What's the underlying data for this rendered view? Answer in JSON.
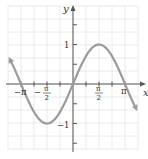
{
  "chart_data": {
    "type": "line",
    "title": "",
    "function": "y = sin x",
    "xlabel": "x",
    "ylabel": "y",
    "xlim": [
      -4.3,
      4.2
    ],
    "ylim": [
      -2.0,
      1.95
    ],
    "x_ticks": [
      {
        "value": -3.14159,
        "label": "-π"
      },
      {
        "value": -1.5708,
        "label": "-π/2"
      },
      {
        "value": 1.5708,
        "label": "π/2"
      },
      {
        "value": 3.14159,
        "label": "π"
      }
    ],
    "y_ticks": [
      {
        "value": 1,
        "label": "1"
      },
      {
        "value": -1,
        "label": "-1"
      }
    ],
    "grid": true,
    "series": [
      {
        "name": "sin x",
        "x": [
          -3.93,
          -3.14159,
          -2.356,
          -1.5708,
          -0.785,
          0,
          0.785,
          1.5708,
          2.356,
          3.14159,
          3.93
        ],
        "values": [
          0.707,
          0,
          -0.707,
          -1,
          -0.707,
          0,
          0.707,
          1,
          0.707,
          0,
          -0.707
        ],
        "arrows_both_ends": true
      }
    ],
    "colors": {
      "curve": "#9a9a9a",
      "axis": "#555555",
      "grid": "#e2e2e2"
    }
  },
  "labels": {
    "x_axis": "x",
    "y_axis": "y",
    "neg_pi": "−π",
    "neg_pi_half_num": "π",
    "neg_pi_half_den": "2",
    "neg_sign": "−",
    "pi_half_num": "π",
    "pi_half_den": "2",
    "pi": "π",
    "one": "1",
    "neg_one": "−1"
  }
}
